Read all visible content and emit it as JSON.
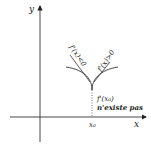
{
  "diagram": {
    "axes": {
      "x_label": "x",
      "y_label": "y"
    },
    "point": {
      "label": "x₀"
    },
    "left_branch_label": "f'(x)<0",
    "right_branch_label": "f'(x)>0",
    "annotation_line1": "f'(x₀)",
    "annotation_line2": "n'existe pas",
    "colors": {
      "ink": "#222222",
      "background": "#ffffff"
    }
  }
}
